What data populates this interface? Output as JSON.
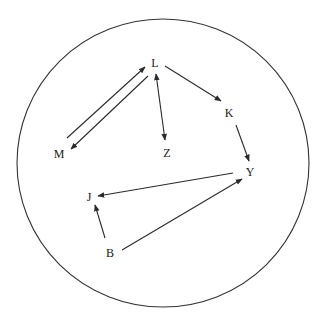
{
  "diagram": {
    "type": "directed-graph",
    "boundary": {
      "shape": "circle",
      "cx": 163,
      "cy": 163,
      "rx": 146,
      "ry": 144
    },
    "colors": {
      "line": "#2a2a2a",
      "text": "#222222",
      "background": "#ffffff"
    },
    "nodes": {
      "L": {
        "label": "L",
        "x": 155,
        "y": 63
      },
      "M": {
        "label": "M",
        "x": 59,
        "y": 154
      },
      "Z": {
        "label": "Z",
        "x": 167,
        "y": 153
      },
      "K": {
        "label": "K",
        "x": 229,
        "y": 113
      },
      "Y": {
        "label": "Y",
        "x": 250,
        "y": 172
      },
      "J": {
        "label": "J",
        "x": 89,
        "y": 197
      },
      "B": {
        "label": "B",
        "x": 110,
        "y": 253
      }
    },
    "edges": [
      {
        "from": "M",
        "to": "L",
        "bidirectional": false,
        "x1": 67,
        "y1": 138,
        "x2": 145,
        "y2": 67
      },
      {
        "from": "L",
        "to": "M",
        "bidirectional": false,
        "x1": 148,
        "y1": 76,
        "x2": 71,
        "y2": 149
      },
      {
        "from": "L",
        "to": "Z",
        "bidirectional": true,
        "x1": 156,
        "y1": 74,
        "x2": 165,
        "y2": 140
      },
      {
        "from": "L",
        "to": "K",
        "bidirectional": false,
        "x1": 165,
        "y1": 66,
        "x2": 221,
        "y2": 101
      },
      {
        "from": "K",
        "to": "Y",
        "bidirectional": false,
        "x1": 236,
        "y1": 125,
        "x2": 249,
        "y2": 161
      },
      {
        "from": "Y",
        "to": "J",
        "bidirectional": false,
        "x1": 233,
        "y1": 173,
        "x2": 98,
        "y2": 196
      },
      {
        "from": "B",
        "to": "J",
        "bidirectional": false,
        "x1": 105,
        "y1": 238,
        "x2": 95,
        "y2": 205
      },
      {
        "from": "B",
        "to": "Y",
        "bidirectional": false,
        "x1": 122,
        "y1": 250,
        "x2": 242,
        "y2": 179
      }
    ]
  }
}
